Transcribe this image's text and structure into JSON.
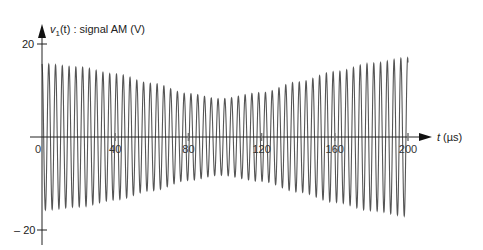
{
  "chart_data": {
    "type": "line",
    "title": "",
    "ylabel": "v1(t) : signal AM (V)",
    "ylabel_parts": {
      "var": "v",
      "sub": "1",
      "rest": "(t) : signal AM (V)"
    },
    "xlabel": "t (µs)",
    "xlabel_parts": {
      "var": "t",
      "rest": " (µs)"
    },
    "x_ticks": [
      0,
      40,
      80,
      120,
      160,
      200
    ],
    "x_tick_labels": [
      "0",
      "40",
      "80",
      "120",
      "160",
      "200"
    ],
    "y_ticks": [
      20,
      -20
    ],
    "y_tick_labels": [
      "20",
      "– 20"
    ],
    "xlim": [
      0,
      200
    ],
    "ylim": [
      -20,
      20
    ],
    "grid": false,
    "legend": null,
    "series": [
      {
        "name": "v1(t)",
        "description": "Amplitude-modulated sinusoid: carrier period ≈ 3.7 µs (~54 cycles over 0–200 µs); envelope ≈ 15.7 V at t=0, minimum ≈ 8 V near t≈97 µs, ≈ 17 V at t=200 µs",
        "carrier_period_us": 3.7,
        "envelope": {
          "t": [
            0,
            20,
            40,
            60,
            80,
            97,
            120,
            140,
            160,
            180,
            200
          ],
          "amplitude": [
            15.7,
            15.0,
            13.5,
            11.5,
            9.3,
            8.2,
            9.5,
            11.8,
            14.0,
            15.8,
            17.0
          ]
        }
      }
    ],
    "line_color": "#555555",
    "axis_color": "#222222"
  }
}
